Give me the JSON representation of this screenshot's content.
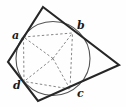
{
  "figure": {
    "canvas": {
      "width": 126,
      "height": 107,
      "background": "#fefefe"
    },
    "colors": {
      "quadrilateral_stroke": "#262626",
      "circle_stroke": "#555555",
      "dashed_stroke": "#777777",
      "label_color": "#1a1a1a"
    },
    "circle": {
      "name": "inscribed-circle",
      "cx": 53,
      "cy": 58.5,
      "r": 37,
      "stroke_width": 1.1
    },
    "quadrilateral": {
      "name": "circumscribed-quadrilateral",
      "stroke_width": 2.1,
      "vertices": [
        {
          "name": "vertex-top",
          "x": 43,
          "y": 7
        },
        {
          "name": "vertex-right",
          "x": 119,
          "y": 65
        },
        {
          "name": "vertex-bottom",
          "x": 38,
          "y": 101
        },
        {
          "name": "vertex-left",
          "x": 8,
          "y": 62
        }
      ],
      "points_attr": "43,7 119,65 38,101 8,62"
    },
    "tangent_points": [
      {
        "id": "a",
        "label": "a",
        "x": 23.5,
        "y": 37.0,
        "label_x": 12,
        "label_y": 30
      },
      {
        "id": "b",
        "label": "b",
        "x": 72.5,
        "y": 33.0,
        "label_x": 77,
        "label_y": 20
      },
      {
        "id": "c",
        "label": "c",
        "x": 70.0,
        "y": 89.0,
        "label_x": 77,
        "label_y": 88
      },
      {
        "id": "d",
        "label": "d",
        "x": 24.0,
        "y": 81.5,
        "label_x": 13,
        "label_y": 80
      }
    ],
    "radii": [
      {
        "name": "radius-to-a",
        "x1": 53,
        "y1": 58.5,
        "x2": 23.5,
        "y2": 37.0
      },
      {
        "name": "radius-to-b",
        "x1": 53,
        "y1": 58.5,
        "x2": 72.5,
        "y2": 33.0
      },
      {
        "name": "radius-to-c",
        "x1": 53,
        "y1": 58.5,
        "x2": 70.0,
        "y2": 89.0
      },
      {
        "name": "radius-to-d",
        "x1": 53,
        "y1": 58.5,
        "x2": 24.0,
        "y2": 81.5
      }
    ],
    "inner_chords": {
      "name": "inner-quadrilateral-abcd",
      "points_attr": "23.5,37.0 72.5,33.0 70.0,89.0 24.0,81.5"
    },
    "dash_pattern": "2.4,2.2",
    "dashed_stroke_width": 0.9
  }
}
